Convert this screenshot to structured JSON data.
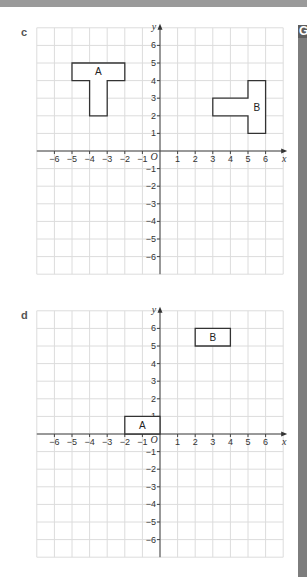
{
  "side_tab": {
    "letter": "G"
  },
  "chart_data": [
    {
      "type": "scatter",
      "part": "c",
      "title": "",
      "xlabel": "x",
      "ylabel": "y",
      "origin_label": "O",
      "xlim": [
        -7,
        7
      ],
      "ylim": [
        -7,
        7
      ],
      "x_ticks": [
        -6,
        -5,
        -4,
        -3,
        -2,
        -1,
        1,
        2,
        3,
        4,
        5,
        6
      ],
      "y_ticks": [
        6,
        5,
        4,
        3,
        2,
        1,
        -1,
        -2,
        -3,
        -4,
        -5,
        -6
      ],
      "grid": true,
      "shapes": [
        {
          "name": "A",
          "label_at": [
            -3.5,
            4.5
          ],
          "points": [
            [
              -5,
              5
            ],
            [
              -2,
              5
            ],
            [
              -2,
              4
            ],
            [
              -3,
              4
            ],
            [
              -3,
              2
            ],
            [
              -4,
              2
            ],
            [
              -4,
              4
            ],
            [
              -5,
              4
            ]
          ]
        },
        {
          "name": "B",
          "label_at": [
            5.5,
            2.5
          ],
          "points": [
            [
              5,
              1
            ],
            [
              6,
              1
            ],
            [
              6,
              4
            ],
            [
              5,
              4
            ],
            [
              5,
              3
            ],
            [
              3,
              3
            ],
            [
              3,
              2
            ],
            [
              5,
              2
            ]
          ]
        }
      ]
    },
    {
      "type": "scatter",
      "part": "d",
      "title": "",
      "xlabel": "x",
      "ylabel": "y",
      "origin_label": "O",
      "xlim": [
        -7,
        7
      ],
      "ylim": [
        -7,
        7
      ],
      "x_ticks": [
        -6,
        -5,
        -4,
        -3,
        -2,
        -1,
        1,
        2,
        3,
        4,
        5,
        6
      ],
      "y_ticks": [
        6,
        5,
        4,
        3,
        2,
        1,
        -1,
        -2,
        -3,
        -4,
        -5,
        -6
      ],
      "grid": true,
      "shapes": [
        {
          "name": "A",
          "label_at": [
            -1,
            0.5
          ],
          "points": [
            [
              -2,
              0
            ],
            [
              0,
              0
            ],
            [
              0,
              1
            ],
            [
              -2,
              1
            ]
          ]
        },
        {
          "name": "B",
          "label_at": [
            3,
            5.5
          ],
          "points": [
            [
              2,
              5
            ],
            [
              4,
              5
            ],
            [
              4,
              6
            ],
            [
              2,
              6
            ]
          ]
        }
      ]
    }
  ]
}
